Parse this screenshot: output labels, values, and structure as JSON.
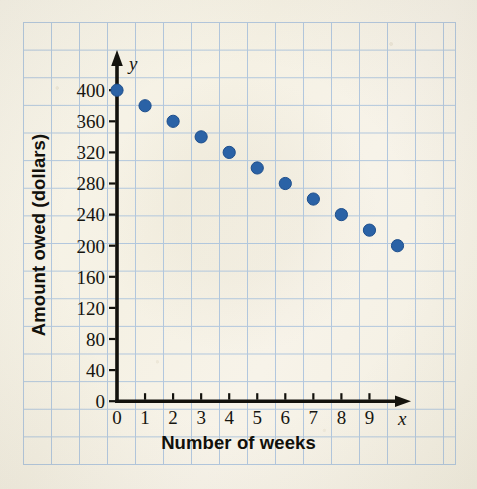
{
  "chart_data": {
    "type": "scatter",
    "title": "",
    "xlabel": "Number of weeks",
    "ylabel": "Amount owed (dollars)",
    "x_axis_variable": "x",
    "y_axis_variable": "y",
    "x": [
      0,
      1,
      2,
      3,
      4,
      5,
      6,
      7,
      8,
      9,
      10
    ],
    "values": [
      400,
      380,
      360,
      340,
      320,
      300,
      280,
      260,
      240,
      220,
      200
    ],
    "series": [
      {
        "name": "Amount owed",
        "values": [
          400,
          380,
          360,
          340,
          320,
          300,
          280,
          260,
          240,
          220,
          200
        ]
      }
    ],
    "points": [
      {
        "x": 0,
        "y": 400
      },
      {
        "x": 1,
        "y": 380
      },
      {
        "x": 2,
        "y": 360
      },
      {
        "x": 3,
        "y": 340
      },
      {
        "x": 4,
        "y": 320
      },
      {
        "x": 5,
        "y": 300
      },
      {
        "x": 6,
        "y": 280
      },
      {
        "x": 7,
        "y": 260
      },
      {
        "x": 8,
        "y": 240
      },
      {
        "x": 9,
        "y": 220
      },
      {
        "x": 10,
        "y": 200
      }
    ],
    "xlim": [
      0,
      10.6
    ],
    "ylim": [
      0,
      430
    ],
    "x_tick_labels": [
      "0",
      "1",
      "2",
      "3",
      "4",
      "5",
      "6",
      "7",
      "8",
      "9"
    ],
    "x_tick_values": [
      0,
      1,
      2,
      3,
      4,
      5,
      6,
      7,
      8,
      9
    ],
    "y_tick_labels": [
      "0",
      "40",
      "80",
      "120",
      "160",
      "200",
      "240",
      "280",
      "320",
      "360",
      "400"
    ],
    "y_tick_values": [
      0,
      40,
      80,
      120,
      160,
      200,
      240,
      280,
      320,
      360,
      400
    ],
    "grid": true,
    "legend": "none",
    "colors": {
      "point": "#2a62a6",
      "point_edge": "#1d4e8c",
      "axis": "#12110c",
      "grid": "#a9c2dd",
      "background": "#f6f2e6",
      "text": "#16150f"
    }
  }
}
